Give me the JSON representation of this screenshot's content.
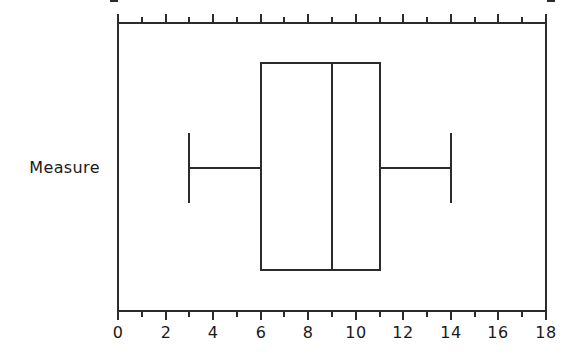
{
  "chart_data": {
    "type": "box",
    "title": "",
    "xlabel": "",
    "ylabel": "",
    "orientation": "horizontal",
    "categories": [
      "Measure"
    ],
    "xlim": [
      0,
      18
    ],
    "x_major_step": 2,
    "x_minor_step": 1,
    "xticklabels": [
      "0",
      "2",
      "4",
      "6",
      "8",
      "10",
      "12",
      "14",
      "16",
      "18"
    ],
    "xtickvalues": [
      0,
      2,
      4,
      6,
      8,
      10,
      12,
      14,
      16,
      18
    ],
    "grid": false,
    "legend": false,
    "series": [
      {
        "name": "Measure",
        "min": 3,
        "q1": 6,
        "median": 9,
        "q3": 11,
        "max": 14,
        "outliers": []
      }
    ],
    "colors": {
      "line": "#2b2b2b",
      "fill": "#ffffff",
      "background": "#ffffff",
      "text": "#1a1a1a"
    }
  },
  "axis": {
    "category_label": "Measure"
  }
}
